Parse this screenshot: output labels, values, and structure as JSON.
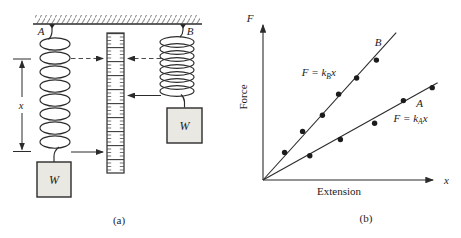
{
  "figure": {
    "panel_a": {
      "caption": "(a)",
      "spring_a_label": "A",
      "spring_b_label": "B",
      "weight_a_label": "W",
      "weight_b_label": "W",
      "extension_label": "x"
    },
    "panel_b": {
      "caption": "(b)"
    }
  },
  "chart_data": {
    "type": "scatter",
    "title": "",
    "xlabel": "Extension",
    "ylabel": "Force",
    "x_axis_symbol": "x",
    "y_axis_symbol": "F",
    "x_ticks": [],
    "y_ticks": [],
    "axis_numbers_shown": false,
    "legend": "none",
    "grid": false,
    "slope_ratio_B_to_A": 2.0,
    "series": [
      {
        "name": "B",
        "equation": {
          "prefix": "F = k",
          "sub": "B",
          "suffix": "x"
        },
        "points": [
          [
            0.12,
            0.17
          ],
          [
            0.22,
            0.3
          ],
          [
            0.33,
            0.4
          ],
          [
            0.42,
            0.53
          ],
          [
            0.52,
            0.63
          ],
          [
            0.63,
            0.74
          ]
        ],
        "line_end": [
          0.74,
          0.91
        ],
        "label_pos": [
          0.64,
          0.83
        ],
        "equation_pos": [
          0.31,
          0.64
        ]
      },
      {
        "name": "A",
        "equation": {
          "prefix": "F = k",
          "sub": "A",
          "suffix": "x"
        },
        "points": [
          [
            0.26,
            0.15
          ],
          [
            0.43,
            0.25
          ],
          [
            0.62,
            0.35
          ],
          [
            0.78,
            0.49
          ],
          [
            0.94,
            0.57
          ]
        ],
        "line_end": [
          0.97,
          0.6
        ],
        "label_pos": [
          0.87,
          0.45
        ],
        "equation_pos": [
          0.82,
          0.36
        ]
      }
    ]
  }
}
